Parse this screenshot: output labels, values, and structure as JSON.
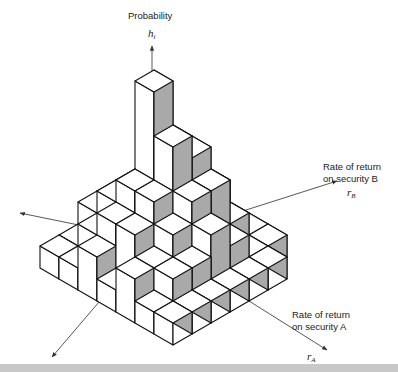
{
  "figure": {
    "type": "isometric-3d-histogram",
    "vertical_axis": {
      "label": "Probability",
      "symbol": "h",
      "subscript": "i"
    },
    "axis_b": {
      "label_line1": "Rate of return",
      "label_line2": "on security B",
      "symbol": "r",
      "subscript": "B"
    },
    "axis_a": {
      "label_line1": "Rate of return",
      "label_line2": "on security A",
      "symbol": "r",
      "subscript": "A"
    },
    "colors": {
      "top": "#ffffff",
      "left": "#ffffff",
      "right": "#a9a9a9",
      "edge": "#111111",
      "axis": "#444444",
      "footer": "#c8c8c8"
    }
  },
  "chart_data": {
    "type": "heatmap",
    "title": "",
    "x_axis": "Rate of return on security A (r_A)",
    "y_axis": "Rate of return on security B (r_B)",
    "z_axis": "Probability h_i",
    "grid_note": "rows = r_A index (0 = back), cols = r_B index (0 = left); values = bar height in stacked blocks",
    "heights": [
      [
        1,
        1,
        2,
        2,
        2,
        1,
        1
      ],
      [
        1,
        2,
        3,
        3,
        3,
        2,
        1
      ],
      [
        2,
        3,
        4,
        8,
        5,
        3,
        1
      ],
      [
        1,
        3,
        4,
        6,
        5,
        3,
        1
      ],
      [
        2,
        2,
        3,
        4,
        4,
        2,
        1
      ],
      [
        1,
        2,
        2,
        3,
        2,
        1,
        1
      ],
      [
        1,
        1,
        1,
        1,
        1,
        1,
        0
      ]
    ]
  }
}
